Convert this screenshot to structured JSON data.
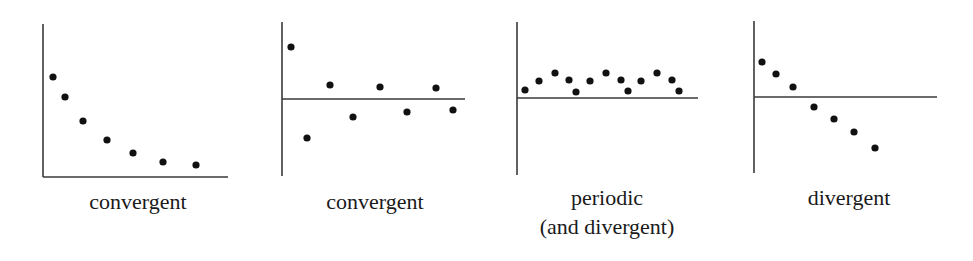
{
  "figure": {
    "colors": {
      "axis": "#3a3a3a",
      "point": "#111111",
      "text": "#1a1a1a"
    },
    "panels": [
      {
        "label_lines": [
          "convergent"
        ],
        "axes": {
          "y_axis": {
            "x": 43,
            "y1": 24,
            "y2": 177
          },
          "x_axis": {
            "y": 177,
            "x1": 43,
            "x2": 228
          }
        },
        "points": [
          [
            53,
            77
          ],
          [
            65,
            97
          ],
          [
            83,
            121
          ],
          [
            107,
            140
          ],
          [
            133,
            153
          ],
          [
            163,
            162
          ],
          [
            196,
            165
          ]
        ],
        "label_center_x": 138,
        "label_top": 187
      },
      {
        "label_lines": [
          "convergent"
        ],
        "axes": {
          "y_axis": {
            "x": 282,
            "y1": 22,
            "y2": 176
          },
          "x_axis": {
            "y": 99,
            "x1": 282,
            "x2": 465
          }
        },
        "points": [
          [
            291,
            47
          ],
          [
            307,
            138
          ],
          [
            330,
            85
          ],
          [
            353,
            117
          ],
          [
            380,
            87
          ],
          [
            407,
            112
          ],
          [
            436,
            88
          ],
          [
            453,
            110
          ]
        ],
        "label_center_x": 375,
        "label_top": 187
      },
      {
        "label_lines": [
          "periodic",
          "(and divergent)"
        ],
        "axes": {
          "y_axis": {
            "x": 517,
            "y1": 22,
            "y2": 175
          },
          "x_axis": {
            "y": 98,
            "x1": 517,
            "x2": 698
          }
        },
        "points": [
          [
            525,
            90
          ],
          [
            539,
            81
          ],
          [
            555,
            73
          ],
          [
            569,
            80
          ],
          [
            576,
            92
          ],
          [
            590,
            81
          ],
          [
            606,
            73
          ],
          [
            621,
            80
          ],
          [
            628,
            91
          ],
          [
            641,
            81
          ],
          [
            657,
            73
          ],
          [
            672,
            80
          ],
          [
            679,
            91
          ]
        ],
        "label_center_x": 607,
        "label_top": 183
      },
      {
        "label_lines": [
          "divergent"
        ],
        "axes": {
          "y_axis": {
            "x": 754,
            "y1": 21,
            "y2": 173
          },
          "x_axis": {
            "y": 97,
            "x1": 754,
            "x2": 937
          }
        },
        "points": [
          [
            762,
            62
          ],
          [
            776,
            74
          ],
          [
            793,
            87
          ],
          [
            814,
            107
          ],
          [
            834,
            119
          ],
          [
            854,
            132
          ],
          [
            875,
            148
          ]
        ],
        "label_center_x": 849,
        "label_top": 183
      }
    ]
  },
  "labels": {
    "panel1": "convergent",
    "panel2": "convergent",
    "panel3_line1": "periodic",
    "panel3_line2": "(and divergent)",
    "panel4": "divergent"
  },
  "chart_data": [
    {
      "type": "scatter",
      "title": "convergent",
      "description": "Monotonically decreasing sequence approaching a limit (decay toward x-axis)",
      "x": [
        1,
        2,
        3,
        4,
        5,
        6,
        7
      ],
      "y": [
        100,
        80,
        56,
        37,
        24,
        15,
        12
      ],
      "xlabel": "",
      "ylabel": "",
      "axis_crossing": "bottom",
      "grid": false
    },
    {
      "type": "scatter",
      "title": "convergent",
      "description": "Damped oscillation alternating above and below the horizontal axis",
      "x": [
        1,
        2,
        3,
        4,
        5,
        6,
        7,
        8
      ],
      "y": [
        52,
        -39,
        14,
        -18,
        12,
        -13,
        11,
        -11
      ],
      "xlabel": "",
      "ylabel": "",
      "axis_crossing": "middle",
      "grid": false
    },
    {
      "type": "scatter",
      "title": "periodic (and divergent)",
      "description": "Repeating pattern of period 4 above the axis",
      "x": [
        1,
        2,
        3,
        4,
        5,
        6,
        7,
        8,
        9,
        10,
        11,
        12,
        13
      ],
      "y": [
        8,
        17,
        25,
        18,
        6,
        17,
        25,
        18,
        7,
        17,
        25,
        18,
        7
      ],
      "xlabel": "",
      "ylabel": "",
      "axis_crossing": "middle",
      "grid": false
    },
    {
      "type": "scatter",
      "title": "divergent",
      "description": "Steadily decreasing sequence crossing the axis and going to negative infinity",
      "x": [
        1,
        2,
        3,
        4,
        5,
        6,
        7
      ],
      "y": [
        35,
        23,
        10,
        -10,
        -22,
        -35,
        -51
      ],
      "xlabel": "",
      "ylabel": "",
      "axis_crossing": "middle",
      "grid": false
    }
  ]
}
